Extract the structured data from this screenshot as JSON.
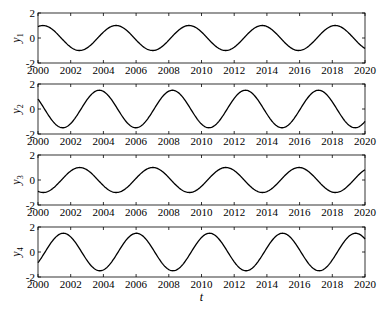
{
  "chart_data": [
    {
      "type": "line",
      "ylabel": "y",
      "ylabel_sub": "1",
      "xlabel": "",
      "xlim": [
        2000,
        2020
      ],
      "ylim": [
        -2,
        2
      ],
      "xticks": [
        "2000",
        "2002",
        "2004",
        "2006",
        "2008",
        "2010",
        "2012",
        "2014",
        "2016",
        "2018",
        "2020"
      ],
      "yticks": [
        "2",
        "0",
        "-2"
      ],
      "amplitude": 1.0,
      "period": 4.47,
      "peak_at": 2000.3,
      "series": [
        {
          "name": "y1",
          "x": [
            2000,
            2000.3,
            2002.6,
            2004.8,
            2007.0,
            2009.3,
            2011.5,
            2013.7,
            2016.0,
            2018.2,
            2020
          ],
          "values": [
            0.98,
            1.0,
            -1.0,
            1.0,
            -1.0,
            1.0,
            -1.0,
            1.0,
            -1.0,
            1.0,
            -0.6
          ]
        }
      ]
    },
    {
      "type": "line",
      "ylabel": "y",
      "ylabel_sub": "2",
      "xlabel": "",
      "xlim": [
        2000,
        2020
      ],
      "ylim": [
        -2,
        2
      ],
      "xticks": [
        "2000",
        "2002",
        "2004",
        "2006",
        "2008",
        "2010",
        "2012",
        "2014",
        "2016",
        "2018",
        "2020"
      ],
      "yticks": [
        "2",
        "0",
        "-2"
      ],
      "amplitude": 1.5,
      "period": 4.47,
      "peak_at": 2003.75,
      "series": [
        {
          "name": "y2",
          "x": [
            2000,
            2001.5,
            2003.75,
            2006.0,
            2008.2,
            2010.4,
            2012.65,
            2014.9,
            2017.1,
            2019.35,
            2020
          ],
          "values": [
            0.7,
            -1.5,
            1.5,
            -1.5,
            1.5,
            -1.5,
            1.5,
            -1.5,
            1.5,
            -1.5,
            -0.7
          ]
        }
      ]
    },
    {
      "type": "line",
      "ylabel": "y",
      "ylabel_sub": "3",
      "xlabel": "",
      "xlim": [
        2000,
        2020
      ],
      "ylim": [
        -2,
        2
      ],
      "xticks": [
        "2000",
        "2002",
        "2004",
        "2006",
        "2008",
        "2010",
        "2012",
        "2014",
        "2016",
        "2018",
        "2020"
      ],
      "yticks": [
        "2",
        "0",
        "-2"
      ],
      "amplitude": 1.0,
      "period": 4.47,
      "peak_at": 2002.55,
      "series": [
        {
          "name": "y3",
          "x": [
            2000,
            2000.3,
            2002.55,
            2004.8,
            2007.0,
            2009.25,
            2011.5,
            2013.7,
            2015.95,
            2018.2,
            2020
          ],
          "values": [
            -0.98,
            -1.0,
            1.0,
            -1.0,
            1.0,
            -1.0,
            1.0,
            -1.0,
            1.0,
            -1.0,
            0.6
          ]
        }
      ]
    },
    {
      "type": "line",
      "ylabel": "y",
      "ylabel_sub": "4",
      "xlabel": "t",
      "xlim": [
        2000,
        2020
      ],
      "ylim": [
        -2,
        2
      ],
      "xticks": [
        "2000",
        "2002",
        "2004",
        "2006",
        "2008",
        "2010",
        "2012",
        "2014",
        "2016",
        "2018",
        "2020"
      ],
      "yticks": [
        "2",
        "0",
        "-2"
      ],
      "amplitude": 1.5,
      "period": 4.47,
      "peak_at": 2001.55,
      "series": [
        {
          "name": "y4",
          "x": [
            2000,
            2001.55,
            2003.8,
            2006.0,
            2008.25,
            2010.5,
            2012.7,
            2014.95,
            2017.2,
            2019.4,
            2020
          ],
          "values": [
            -0.7,
            1.5,
            -1.5,
            1.5,
            -1.5,
            1.5,
            -1.5,
            1.5,
            -1.5,
            1.5,
            0.9
          ]
        }
      ]
    }
  ],
  "style": {
    "line_color": "#000000",
    "axis_color": "#000000",
    "background": "#ffffff"
  }
}
